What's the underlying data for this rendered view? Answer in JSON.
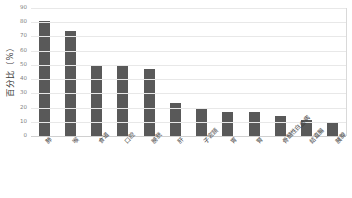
{
  "chart_data": {
    "type": "bar",
    "title": "",
    "subtitle": "",
    "xlabel": "",
    "ylabel": "百分比（%）",
    "ylim": [
      0,
      90
    ],
    "yticks": [
      0,
      10,
      20,
      30,
      40,
      50,
      60,
      70,
      80,
      90
    ],
    "grid": true,
    "legend": false,
    "legend_position": "none",
    "bar_color": "#595959",
    "gridline_color": "#e8e8e8",
    "axis_text_color": "#7f7f7f",
    "categories": [
      "肺",
      "喉",
      "食道",
      "口腔",
      "膀胱",
      "肝",
      "子宮頸",
      "胃",
      "腎",
      "骨髓性白血病",
      "結直腸",
      "胰腺"
    ],
    "values": [
      81,
      74,
      50,
      49,
      47,
      23,
      20,
      17,
      17,
      14,
      11,
      10
    ]
  }
}
